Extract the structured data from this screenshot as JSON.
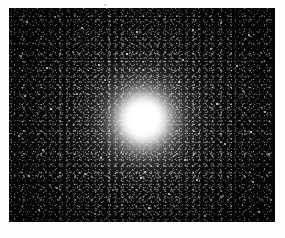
{
  "page": {
    "background_color": "#fefefe",
    "width": 285,
    "height": 238
  },
  "photo": {
    "subject": "globular star cluster",
    "alt_text": "Black-and-white astronomical photograph of a globular star cluster: a dense spherical swarm of thousands of stars with a saturated white unresolved core fading outward into individually resolved points against a black sky.",
    "frame": {
      "x": 9,
      "y": 8,
      "width": 266,
      "height": 214
    },
    "sky_color": "#050505",
    "star_color": "#ffffff",
    "core_color": "#ffffff",
    "core_center": {
      "x_pct": 50.5,
      "y_pct": 52
    },
    "core_radius_pct": 9,
    "halo_radius_pct": 46,
    "orientation": "landscape",
    "medium": "monochrome photographic print"
  },
  "marks": {
    "paper_speck": {
      "x": 104,
      "y": 4
    }
  }
}
